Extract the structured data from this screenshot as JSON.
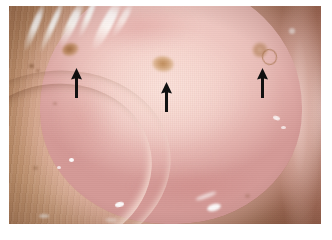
{
  "figure": {
    "domain": "clinical-photograph",
    "caption": "",
    "background_color": "#ffffff",
    "frame": {
      "x": 9,
      "y": 6,
      "width": 312,
      "height": 218,
      "margin_color": "#ffffff"
    }
  },
  "colors": {
    "paper_white": "#ffffff",
    "periphery_tan": "#d7ae8c",
    "periphery_brown": "#a86a58",
    "dome_pale_pink": "#f3d2cb",
    "dome_mid_pink": "#e7bab5",
    "dome_edge_pink": "#d59a97",
    "rim_gloss": "#ffe2de",
    "lesion_brown": "#96602f",
    "lesion_tan": "#c4905 6",
    "arrow_black": "#101010",
    "specular_white": "#ffffff"
  },
  "annotations": {
    "count": 3,
    "glyph": "arrow-up",
    "color": "#101010",
    "arrows": [
      {
        "id": "arrow-1",
        "label": "left-arrow",
        "points_to": "left-lesion",
        "tip_x": 76,
        "tip_y": 68,
        "tail_x": 76,
        "tail_y": 98,
        "length_px": 30,
        "direction": "up"
      },
      {
        "id": "arrow-2",
        "label": "center-arrow",
        "points_to": "center-lesion",
        "tip_x": 166,
        "tip_y": 82,
        "tail_x": 166,
        "tail_y": 112,
        "length_px": 30,
        "direction": "up"
      },
      {
        "id": "arrow-3",
        "label": "right-arrow",
        "points_to": "right-lesion",
        "tip_x": 262,
        "tip_y": 68,
        "tail_x": 262,
        "tail_y": 98,
        "length_px": 30,
        "direction": "up"
      }
    ]
  },
  "features": {
    "lesions": [
      {
        "id": "left-lesion",
        "x": 70,
        "y": 49,
        "width": 17,
        "height": 13,
        "color": "#96602f",
        "description": "small dark brown macule"
      },
      {
        "id": "center-lesion",
        "x": 163,
        "y": 64,
        "width": 22,
        "height": 16,
        "color": "#c49056",
        "description": "tan raised macule"
      },
      {
        "id": "right-lesion",
        "x": 260,
        "y": 50,
        "width": 16,
        "height": 16,
        "color": "#b07c50",
        "description": "pale ringed lesion"
      }
    ],
    "specular_highlights": [
      {
        "id": "streak-upper-left",
        "description": "diagonal white light streaks across upper-left"
      },
      {
        "id": "gloss-bottom-center",
        "description": "bright white reflection near bottom center-right"
      },
      {
        "id": "rim-gloss-right",
        "description": "glossy curved rim reflection on the right edge"
      }
    ],
    "structures": [
      {
        "id": "central-dome",
        "description": "pale pink mucosal dome occupying the center"
      },
      {
        "id": "peripheral-wall",
        "description": "tan-brown striated peripheral tissue / vault wall"
      },
      {
        "id": "lower-left-fold",
        "description": "curved pale fold crossing the lower-left"
      },
      {
        "id": "right-rim",
        "description": "curved glossy pink rim along the right edge"
      }
    ]
  }
}
